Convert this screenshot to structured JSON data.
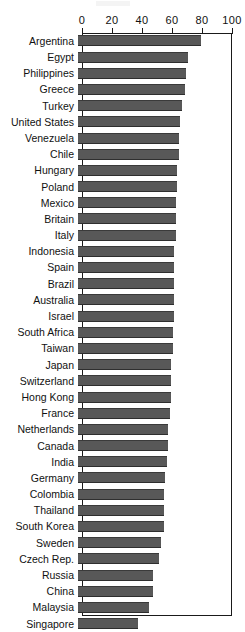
{
  "chart_data": {
    "type": "bar",
    "orientation": "horizontal",
    "title": "",
    "xlabel": "",
    "ylabel": "",
    "xlim": [
      0,
      100
    ],
    "xticks": [
      0,
      20,
      40,
      60,
      80,
      100
    ],
    "grid": false,
    "legend": null,
    "bar_color": "#585858",
    "categories": [
      "Argentina",
      "Egypt",
      "Philippines",
      "Greece",
      "Turkey",
      "United States",
      "Venezuela",
      "Chile",
      "Hungary",
      "Poland",
      "Mexico",
      "Britain",
      "Italy",
      "Indonesia",
      "Spain",
      "Brazil",
      "Australia",
      "Israel",
      "South Africa",
      "Taiwan",
      "Japan",
      "Switzerland",
      "Hong Kong",
      "France",
      "Netherlands",
      "Canada",
      "India",
      "Germany",
      "Colombia",
      "Thailand",
      "South Korea",
      "Sweden",
      "Czech Rep.",
      "Russia",
      "China",
      "Malaysia",
      "Singapore"
    ],
    "values": [
      82,
      73,
      72,
      71,
      69,
      68,
      67,
      67,
      66,
      66,
      65,
      65,
      65,
      64,
      64,
      64,
      64,
      64,
      63,
      63,
      62,
      62,
      62,
      61,
      60,
      60,
      59,
      58,
      57,
      57,
      57,
      55,
      54,
      50,
      50,
      47,
      40
    ]
  },
  "axis": {
    "ticks": [
      {
        "label": "0",
        "value": 0
      },
      {
        "label": "20",
        "value": 20
      },
      {
        "label": "40",
        "value": 40
      },
      {
        "label": "60",
        "value": 60
      },
      {
        "label": "80",
        "value": 80
      },
      {
        "label": "100",
        "value": 100
      }
    ]
  }
}
